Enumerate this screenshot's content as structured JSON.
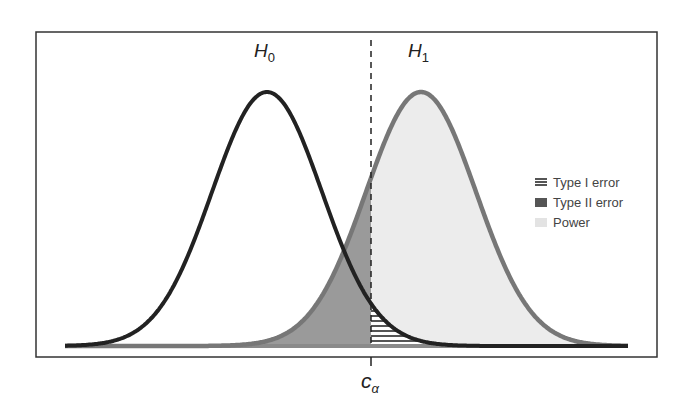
{
  "chart_data": {
    "type": "area",
    "title": "",
    "xlabel": "",
    "ylabel": "",
    "grid": false,
    "legend_position": "right",
    "distributions": [
      {
        "name": "H0",
        "label_main": "H",
        "label_sub": "0",
        "mean_px": 267,
        "sigma_px": 55,
        "line_color": "#222222"
      },
      {
        "name": "H1",
        "label_main": "H",
        "label_sub": "1",
        "mean_px": 421,
        "sigma_px": 55,
        "line_color": "#777777"
      }
    ],
    "critical_value": {
      "label_main": "c",
      "label_sub": "α",
      "x_px": 371,
      "line_style": "dashed"
    },
    "regions": [
      {
        "name": "Type I error",
        "description": "area under H0 right of c_alpha",
        "fill": "horizontal hatch"
      },
      {
        "name": "Type II error",
        "description": "area under H1 left of c_alpha",
        "fill": "#999999"
      },
      {
        "name": "Power",
        "description": "area under H1 right of c_alpha",
        "fill": "#ececec"
      }
    ]
  },
  "labels": {
    "h0_main": "H",
    "h0_sub": "0",
    "h1_main": "H",
    "h1_sub": "1",
    "calpha_main": "c",
    "calpha_sub": "α"
  },
  "legend": {
    "items": [
      {
        "label": "Type I error",
        "style": "hatch"
      },
      {
        "label": "Type II error",
        "style": "dark"
      },
      {
        "label": "Power",
        "style": "light"
      }
    ]
  },
  "colors": {
    "frame": "#333333",
    "h0_line": "#222222",
    "h1_line": "#777777",
    "type2_fill": "#999999",
    "power_fill": "#ececec",
    "hatch": "#555555"
  }
}
